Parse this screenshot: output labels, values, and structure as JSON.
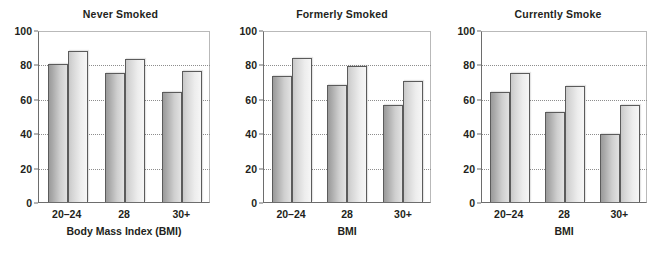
{
  "chart_data": {
    "type": "bar",
    "title": "",
    "panels": [
      {
        "title": "Never Smoked",
        "xlabel": "Body Mass Index (BMI)",
        "ylabel": "",
        "categories": [
          "20–24",
          "28",
          "30+"
        ],
        "ylim": [
          0,
          100
        ],
        "yticks": [
          0,
          20,
          40,
          60,
          80,
          100
        ],
        "gridlines": [
          20,
          40,
          60,
          80
        ],
        "series": [
          {
            "name": "bar-a",
            "values": [
              81,
              76,
              65
            ]
          },
          {
            "name": "bar-b",
            "values": [
              89,
              84,
              77
            ]
          }
        ]
      },
      {
        "title": "Formerly Smoked",
        "xlabel": "BMI",
        "ylabel": "",
        "categories": [
          "20–24",
          "28",
          "30+"
        ],
        "ylim": [
          0,
          100
        ],
        "yticks": [
          0,
          20,
          40,
          60,
          80,
          100
        ],
        "gridlines": [
          20,
          40,
          60,
          80
        ],
        "series": [
          {
            "name": "bar-a",
            "values": [
              74,
              69,
              57
            ]
          },
          {
            "name": "bar-b",
            "values": [
              85,
              80,
              71
            ]
          }
        ]
      },
      {
        "title": "Currently Smoke",
        "xlabel": "BMI",
        "ylabel": "",
        "categories": [
          "20–24",
          "28",
          "30+"
        ],
        "ylim": [
          0,
          100
        ],
        "yticks": [
          0,
          20,
          40,
          60,
          80,
          100
        ],
        "gridlines": [
          20,
          40,
          60,
          80
        ],
        "series": [
          {
            "name": "bar-a",
            "values": [
              65,
              53,
              40
            ]
          },
          {
            "name": "bar-b",
            "values": [
              76,
              68,
              57
            ]
          }
        ]
      }
    ],
    "ytick_labels": [
      "0",
      "20",
      "40",
      "60",
      "80",
      "100"
    ],
    "legend": [],
    "grid": true,
    "colors": {
      "bar_a_dark": "#9a9a9a",
      "bar_a_light": "#e2e2e2",
      "bar_b_dark": "#c9c9c9",
      "bar_b_light": "#f6f6f6",
      "bar_outline": "#5b5b5b",
      "axis": "#6d6d6d",
      "gridline": "#8d8d8d",
      "text": "#231f20",
      "background": "#ffffff"
    }
  }
}
